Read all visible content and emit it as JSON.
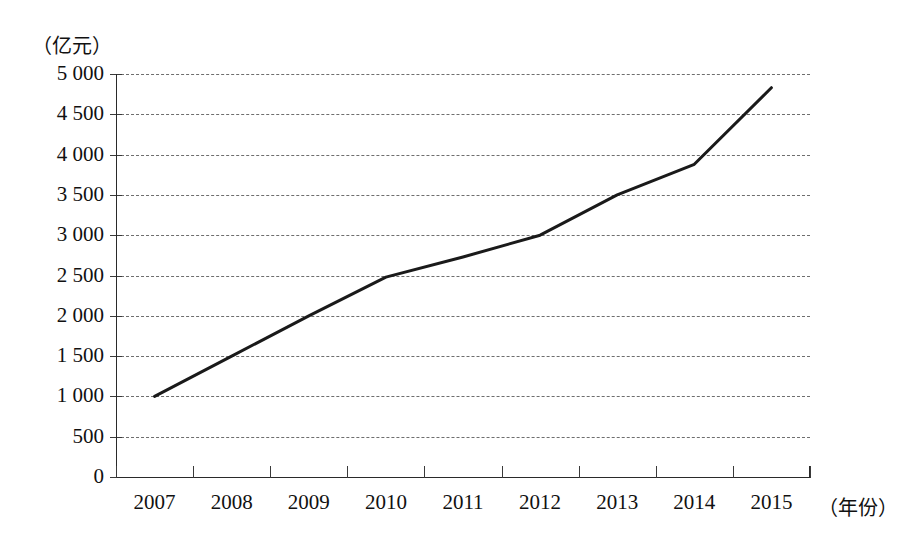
{
  "chart_data": {
    "type": "line",
    "title": "",
    "subtitle": "",
    "xlabel": "（年份）",
    "ylabel": "（亿元）",
    "categories": [
      "2007",
      "2008",
      "2009",
      "2010",
      "2011",
      "2012",
      "2013",
      "2014",
      "2015"
    ],
    "x": [
      2007,
      2008,
      2009,
      2010,
      2011,
      2012,
      2013,
      2014,
      2015
    ],
    "values": [
      1000,
      1500,
      2000,
      2480,
      2730,
      3000,
      3500,
      3880,
      4830
    ],
    "series": [
      {
        "name": "",
        "values": [
          1000,
          1500,
          2000,
          2480,
          2730,
          3000,
          3500,
          3880,
          4830
        ],
        "color": "#1a1a1a"
      }
    ],
    "ylim": [
      0,
      5000
    ],
    "ytick_values": [
      0,
      500,
      1000,
      1500,
      2000,
      2500,
      3000,
      3500,
      4000,
      4500,
      5000
    ],
    "ytick_labels": [
      "0",
      "500",
      "1 000",
      "1 500",
      "2 000",
      "2 500",
      "3 000",
      "3 500",
      "4 000",
      "4 500",
      "5 000"
    ],
    "grid": true,
    "grid_style": "dashed-horizontal",
    "legend": "none",
    "legend_position": "none",
    "line_color": "#1a1a1a",
    "line_width": 3,
    "markers": false,
    "background_color": "#ffffff",
    "axis_color": "#2a2a2a",
    "gridline_color": "#6e6e6e"
  },
  "axes": {
    "y_unit_caption": "（亿元）",
    "x_unit_caption": "（年份）"
  }
}
